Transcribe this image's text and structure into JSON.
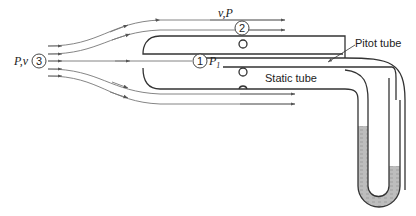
{
  "diagram": {
    "labels": {
      "inlet": "P,v",
      "inlet_point": "3",
      "outer": "v,P",
      "outer_point": "2",
      "stagnation_point": "1",
      "stagnation_pressure": "P",
      "stagnation_subscript": "1",
      "pitot": "Pitot tube",
      "static": "Static tube"
    },
    "colors": {
      "stroke": "#333333",
      "flow": "#777777",
      "fluid": "#b8b8b8"
    }
  }
}
